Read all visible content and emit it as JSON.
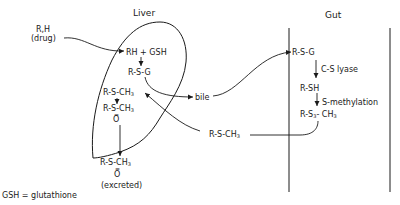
{
  "regions": {
    "liver": {
      "title": "Liver"
    },
    "gut": {
      "title": "Gut"
    }
  },
  "input": {
    "line1": "R,H",
    "line2": "(drug)"
  },
  "liver": {
    "reaction": "RH + GSH",
    "conjugate": "R-S-G",
    "methyl": "R-S-CH",
    "sulfoxide_left": "R-S-CH",
    "sulfoxide_o": "O"
  },
  "bile": "bile",
  "gut": {
    "conjugate": "R-S-G",
    "lyase": "C-S lyase",
    "thiol": "R-SH",
    "methylation": "S-methylation",
    "methyl": "R-S",
    "methyl_sub": "3",
    "methyl_ch": "CH"
  },
  "transport": {
    "methyl": "R-S-CH"
  },
  "excreted": {
    "formula": "R-S-CH",
    "o": "O",
    "label": "(excreted)"
  },
  "subscript3": "3",
  "legend": "GSH = glutathione",
  "colors": {
    "ink": "#1a1a1a",
    "background": "#ffffff"
  }
}
